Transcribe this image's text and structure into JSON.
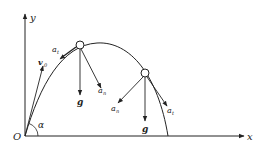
{
  "diagram": {
    "axes": {
      "x_label": "x",
      "y_label": "y",
      "origin_label": "O"
    },
    "angle_label": "α",
    "initial_velocity_label": "v",
    "initial_velocity_subscript": "0",
    "point1": {
      "tangential_label": "a",
      "tangential_sub": "t",
      "gravity_label": "g",
      "normal_label": "a",
      "normal_sub": "n"
    },
    "point2": {
      "normal_label": "a",
      "normal_sub": "n",
      "gravity_label": "g",
      "tangential_label": "a",
      "tangential_sub": "t"
    },
    "colors": {
      "stroke": "#222222",
      "background": "#ffffff"
    }
  }
}
